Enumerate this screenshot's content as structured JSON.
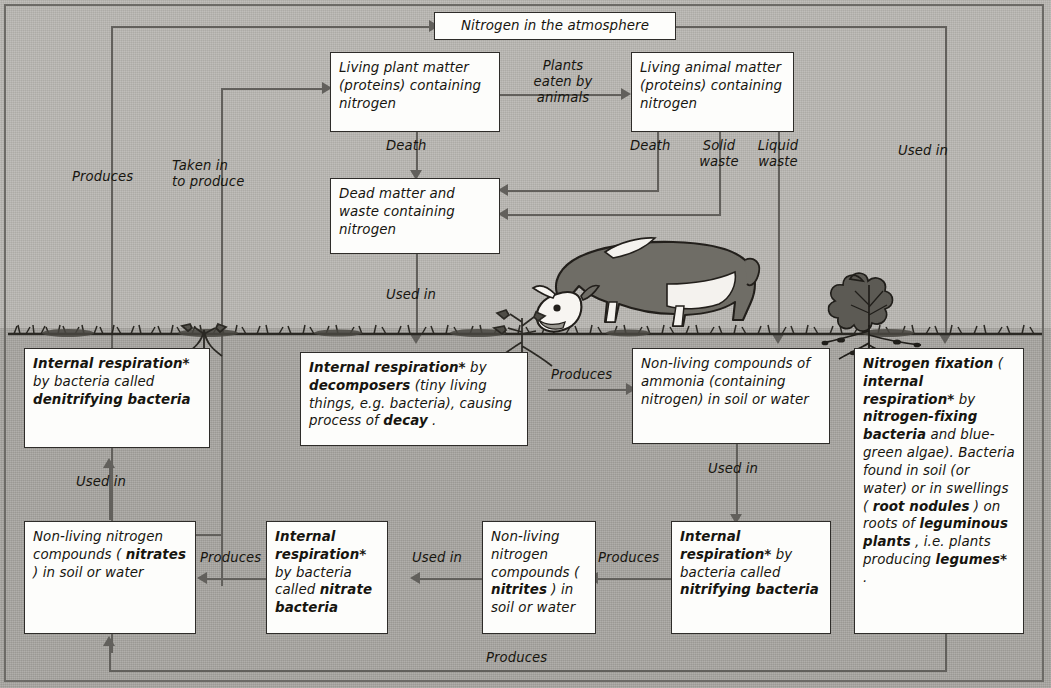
{
  "diagram": {
    "background": {
      "sky_color": "#b9b7b2",
      "soil_color": "#a9a7a2",
      "line_color": "#62605c",
      "box_fill": "#fdfdfb",
      "box_border": "#2e2c29"
    }
  },
  "boxes": {
    "atmosphere": "Nitrogen in the atmosphere",
    "living_plant": "Living plant matter (proteins) containing nitrogen",
    "living_animal": "Living animal matter (proteins) containing nitrogen",
    "dead_matter": "Dead matter and waste containing nitrogen",
    "denitrifying": "Internal respiration* by bacteria called denitrifying bacteria",
    "decomposers": "Internal respiration* by decomposers (tiny living things, e.g. bacteria), causing process of decay.",
    "ammonia": "Non-living compounds of ammonia (containing nitrogen) in soil or water",
    "nitrogen_fixation": "Nitrogen fixation (internal respiration* by nitrogen-fixing bacteria and blue-green algae). Bacteria found in soil (or water) or in swellings (root nodules) on roots of leguminous plants, i.e. plants producing legumes*.",
    "nitrates": "Non-living nitrogen compounds (nitrates) in soil or water",
    "nitrate_bacteria": "Internal respiration* by bacteria called nitrate bacteria",
    "nitrites": "Non-living nitrogen compounds (nitrites) in soil or water",
    "nitrifying": "Internal respiration* by bacteria called nitrifying bacteria"
  },
  "labels": {
    "produces_left": "Produces",
    "taken_in": "Taken in\nto produce",
    "plants_eaten": "Plants\neaten by\nanimals",
    "death_plant": "Death",
    "death_animal": "Death",
    "solid_waste": "Solid\nwaste",
    "liquid_waste": "Liquid\nwaste",
    "used_in_right": "Used in",
    "used_in_dead": "Used in",
    "produces_ammonia": "Produces",
    "used_in_denitrifying": "Used in",
    "used_in_nitrifying": "Used in",
    "produces_nitrates": "Produces",
    "used_in_nitrites": "Used in",
    "produces_nitrites": "Produces",
    "produces_bottom": "Produces"
  },
  "illustrations": {
    "cow": "grazing-cow",
    "leguminous_plant": "leguminous-plant-with-root-nodules",
    "seedling": "small-plant-with-roots",
    "grass": "grass-line"
  }
}
